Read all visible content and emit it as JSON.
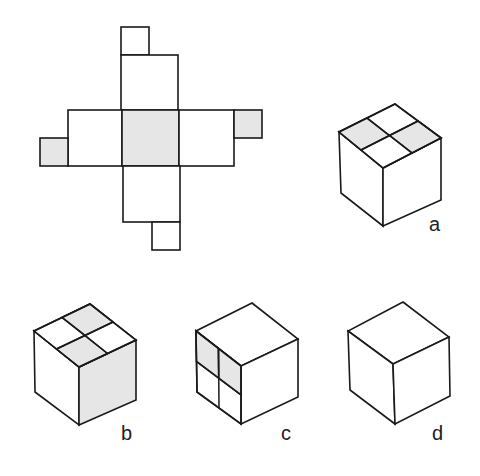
{
  "figure": {
    "shade_color": "#e6e6e6",
    "line_color": "#1a1a1a"
  },
  "net": {
    "faces": [
      {
        "name": "top-column-face",
        "shaded": false
      },
      {
        "name": "left-row-face",
        "shaded": false
      },
      {
        "name": "center-face",
        "shaded": true
      },
      {
        "name": "right-row-face",
        "shaded": false
      },
      {
        "name": "bottom-column-face",
        "shaded": false
      }
    ],
    "tabs": [
      {
        "name": "top-tab",
        "shaded": false
      },
      {
        "name": "left-tab",
        "shaded": true
      },
      {
        "name": "right-tab",
        "shaded": true
      },
      {
        "name": "bottom-tab",
        "shaded": false
      }
    ]
  },
  "options": [
    {
      "label": "a",
      "shading": "top face split in 4, left and right quadrants shaded"
    },
    {
      "label": "b",
      "shading": "top face split in 4, back and front quadrants shaded; right face shaded"
    },
    {
      "label": "c",
      "shading": "left face split in 4, upper two quadrants shaded"
    },
    {
      "label": "d",
      "shading": "no shading"
    }
  ]
}
